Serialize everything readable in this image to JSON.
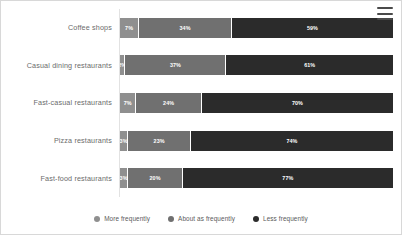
{
  "menu": {
    "icon": "hamburger-menu-icon",
    "label": "Chart context menu"
  },
  "colors": {
    "more_frequently": "#8f8f8f",
    "about_as_frequently": "#707070",
    "less_frequently": "#2b2b2b",
    "card_border": "#d8d8d8",
    "axis_line": "#e2e2e2",
    "label_text": "#6b6b6b",
    "legend_text": "#5a5a5a",
    "bar_label_text": "#ffffff"
  },
  "legend": {
    "position": "bottom",
    "items": [
      {
        "label": "More frequently",
        "color": "#8f8f8f",
        "dot": "legend-dot-icon"
      },
      {
        "label": "About as frequently",
        "color": "#707070",
        "dot": "legend-dot-icon"
      },
      {
        "label": "Less frequently",
        "color": "#2b2b2b",
        "dot": "legend-dot-icon"
      }
    ]
  },
  "chart_data": {
    "type": "bar",
    "orientation": "horizontal",
    "stacked": true,
    "stack_total": 100,
    "title": "",
    "subtitle": "",
    "xlabel": "",
    "ylabel": "",
    "xlim": [
      0,
      100
    ],
    "grid": false,
    "unit": "%",
    "categories": [
      "Coffee shops",
      "Casual dining restaurants",
      "Fast-casual restaurants",
      "Pizza restaurants",
      "Fast-food restaurants"
    ],
    "series": [
      {
        "name": "More frequently",
        "color": "#8f8f8f",
        "values": [
          7,
          2,
          6,
          3,
          3
        ]
      },
      {
        "name": "About as frequently",
        "color": "#707070",
        "values": [
          34,
          37,
          24,
          23,
          20
        ]
      },
      {
        "name": "Less frequently",
        "color": "#2b2b2b",
        "values": [
          59,
          61,
          70,
          74,
          77
        ]
      }
    ],
    "rows": [
      {
        "category": "Coffee shops",
        "segments": [
          {
            "series": "More frequently",
            "value": 7,
            "label": "7%"
          },
          {
            "series": "About as frequently",
            "value": 34,
            "label": "34%"
          },
          {
            "series": "Less frequently",
            "value": 59,
            "label": "59%"
          }
        ]
      },
      {
        "category": "Casual dining restaurants",
        "segments": [
          {
            "series": "More frequently",
            "value": 2,
            "label": "2%"
          },
          {
            "series": "About as frequently",
            "value": 37,
            "label": "37%"
          },
          {
            "series": "Less frequently",
            "value": 61,
            "label": "61%"
          }
        ]
      },
      {
        "category": "Fast-casual restaurants",
        "segments": [
          {
            "series": "More frequently",
            "value": 6,
            "label": "7%"
          },
          {
            "series": "About as frequently",
            "value": 24,
            "label": "24%"
          },
          {
            "series": "Less frequently",
            "value": 70,
            "label": "70%"
          }
        ]
      },
      {
        "category": "Pizza restaurants",
        "segments": [
          {
            "series": "More frequently",
            "value": 3,
            "label": "3%"
          },
          {
            "series": "About as frequently",
            "value": 23,
            "label": "23%"
          },
          {
            "series": "Less frequently",
            "value": 74,
            "label": "74%"
          }
        ]
      },
      {
        "category": "Fast-food restaurants",
        "segments": [
          {
            "series": "More frequently",
            "value": 3,
            "label": "3%"
          },
          {
            "series": "About as frequently",
            "value": 20,
            "label": "20%"
          },
          {
            "series": "Less frequently",
            "value": 77,
            "label": "77%"
          }
        ]
      }
    ]
  }
}
